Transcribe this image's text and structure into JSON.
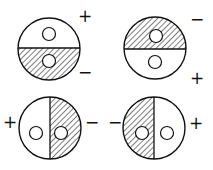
{
  "diagram": {
    "colors": {
      "stroke": "#111111",
      "background": "#ffffff"
    },
    "elements": [
      {
        "id": "top-left",
        "hatched_half": "bottom",
        "signs": [
          {
            "label": "+",
            "pos": "top-right"
          },
          {
            "label": "−",
            "pos": "bottom-right"
          }
        ]
      },
      {
        "id": "top-right",
        "hatched_half": "top",
        "signs": [
          {
            "label": "−",
            "pos": "top-right"
          },
          {
            "label": "+",
            "pos": "bottom-right"
          }
        ]
      },
      {
        "id": "bottom-left",
        "hatched_half": "right",
        "signs": [
          {
            "label": "+",
            "pos": "left"
          },
          {
            "label": "−",
            "pos": "right"
          }
        ]
      },
      {
        "id": "bottom-right",
        "hatched_half": "left",
        "signs": [
          {
            "label": "−",
            "pos": "left"
          },
          {
            "label": "+",
            "pos": "right"
          }
        ]
      }
    ],
    "labels": {
      "tl_plus": "+",
      "tl_minus": "−",
      "tr_minus": "−",
      "tr_plus": "+",
      "bl_plus": "+",
      "bl_minus": "−",
      "br_minus": "−",
      "br_plus": "+"
    }
  }
}
